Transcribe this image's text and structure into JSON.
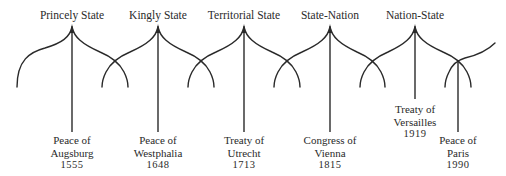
{
  "diagram": {
    "stroke_color": "#2a2a2a",
    "states": [
      {
        "label": "Princely State",
        "x": 72
      },
      {
        "label": "Kingly State",
        "x": 158
      },
      {
        "label": "Territorial State",
        "x": 244
      },
      {
        "label": "State-Nation",
        "x": 330
      },
      {
        "label": "Nation-State",
        "x": 415
      }
    ],
    "events": [
      {
        "line1": "Peace of",
        "line2": "Augsburg",
        "year": "1555",
        "x": 72
      },
      {
        "line1": "Peace of",
        "line2": "Westphalia",
        "year": "1648",
        "x": 158
      },
      {
        "line1": "Treaty of",
        "line2": "Utrecht",
        "year": "1713",
        "x": 244
      },
      {
        "line1": "Congress of",
        "line2": "Vienna",
        "year": "1815",
        "x": 330
      },
      {
        "line1": "Treaty of",
        "line2": "Versailles",
        "year": "1919",
        "x": 415
      },
      {
        "line1": "Peace of",
        "line2": "Paris",
        "year": "1990",
        "x": 458
      }
    ]
  }
}
